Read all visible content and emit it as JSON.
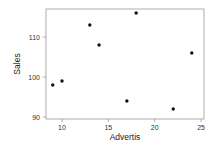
{
  "chart_data": {
    "type": "scatter",
    "title": "",
    "xlabel": "Advertis",
    "ylabel": "Sales",
    "xlim": [
      8.5,
      25.5
    ],
    "ylim": [
      89.5,
      117.5
    ],
    "xticks": [
      10,
      15,
      20,
      25
    ],
    "yticks": [
      90,
      100,
      110
    ],
    "grid": false,
    "legend": null,
    "points": [
      {
        "x": 9,
        "y": 98
      },
      {
        "x": 10,
        "y": 99
      },
      {
        "x": 13,
        "y": 113
      },
      {
        "x": 14,
        "y": 108
      },
      {
        "x": 18,
        "y": 116
      },
      {
        "x": 17,
        "y": 94
      },
      {
        "x": 22,
        "y": 92
      },
      {
        "x": 24,
        "y": 106
      }
    ]
  },
  "style": {
    "frame_color": "#999999",
    "point_color": "#111111",
    "text_color": "#333333"
  }
}
